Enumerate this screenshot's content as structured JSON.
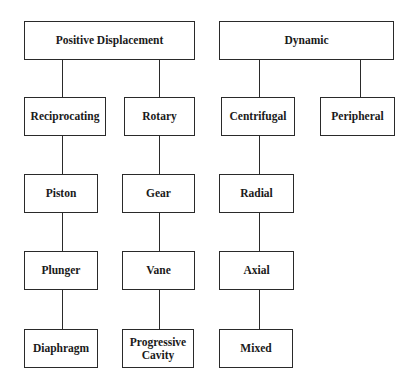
{
  "diagram": {
    "type": "tree",
    "title": "",
    "nodes": [
      {
        "id": "positive_displacement",
        "label": "Positive Displacement",
        "x": 24,
        "y": 21,
        "w": 171,
        "h": 39
      },
      {
        "id": "dynamic",
        "label": "Dynamic",
        "x": 219,
        "y": 21,
        "w": 175,
        "h": 39
      },
      {
        "id": "reciprocating",
        "label": "Reciprocating",
        "x": 24,
        "y": 97,
        "w": 82,
        "h": 39
      },
      {
        "id": "rotary",
        "label": "Rotary",
        "x": 124,
        "y": 97,
        "w": 71,
        "h": 39
      },
      {
        "id": "centrifugal",
        "label": "Centrifugal",
        "x": 221,
        "y": 97,
        "w": 74,
        "h": 39
      },
      {
        "id": "peripheral",
        "label": "Peripheral",
        "x": 320,
        "y": 97,
        "w": 75,
        "h": 39
      },
      {
        "id": "piston",
        "label": "Piston",
        "x": 24,
        "y": 174,
        "w": 74,
        "h": 39
      },
      {
        "id": "gear",
        "label": "Gear",
        "x": 122,
        "y": 174,
        "w": 73,
        "h": 39
      },
      {
        "id": "radial",
        "label": "Radial",
        "x": 219,
        "y": 174,
        "w": 75,
        "h": 39
      },
      {
        "id": "plunger",
        "label": "Plunger",
        "x": 24,
        "y": 251,
        "w": 74,
        "h": 39
      },
      {
        "id": "vane",
        "label": "Vane",
        "x": 122,
        "y": 251,
        "w": 73,
        "h": 39
      },
      {
        "id": "axial",
        "label": "Axial",
        "x": 219,
        "y": 251,
        "w": 75,
        "h": 39
      },
      {
        "id": "diaphragm",
        "label": "Diaphragm",
        "x": 24,
        "y": 329,
        "w": 74,
        "h": 39
      },
      {
        "id": "progressive_cavity",
        "label": "Progressive Cavity",
        "x": 122,
        "y": 329,
        "w": 72,
        "h": 39
      },
      {
        "id": "mixed",
        "label": "Mixed",
        "x": 219,
        "y": 329,
        "w": 74,
        "h": 39
      }
    ],
    "edges": [
      {
        "from": "positive_displacement",
        "to": "reciprocating",
        "x": 62,
        "y1": 60,
        "y2": 97
      },
      {
        "from": "positive_displacement",
        "to": "rotary",
        "x": 159,
        "y1": 60,
        "y2": 97
      },
      {
        "from": "dynamic",
        "to": "centrifugal",
        "x": 259,
        "y1": 60,
        "y2": 97
      },
      {
        "from": "dynamic",
        "to": "peripheral",
        "x": 360,
        "y1": 60,
        "y2": 97
      },
      {
        "from": "reciprocating",
        "to": "piston",
        "x": 62,
        "y1": 136,
        "y2": 174
      },
      {
        "from": "piston",
        "to": "plunger",
        "x": 62,
        "y1": 213,
        "y2": 251
      },
      {
        "from": "plunger",
        "to": "diaphragm",
        "x": 62,
        "y1": 290,
        "y2": 329
      },
      {
        "from": "rotary",
        "to": "gear",
        "x": 159,
        "y1": 136,
        "y2": 174
      },
      {
        "from": "gear",
        "to": "vane",
        "x": 159,
        "y1": 213,
        "y2": 251
      },
      {
        "from": "vane",
        "to": "progressive_cavity",
        "x": 159,
        "y1": 290,
        "y2": 329
      },
      {
        "from": "centrifugal",
        "to": "radial",
        "x": 259,
        "y1": 136,
        "y2": 174
      },
      {
        "from": "radial",
        "to": "axial",
        "x": 259,
        "y1": 213,
        "y2": 251
      },
      {
        "from": "axial",
        "to": "mixed",
        "x": 259,
        "y1": 290,
        "y2": 329
      }
    ],
    "colors": {
      "line": "#2a2a2a",
      "background": "#ffffff",
      "text": "#1a1a1a"
    }
  }
}
